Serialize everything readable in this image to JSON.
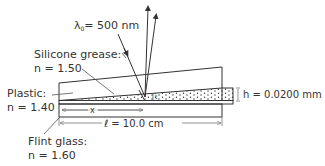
{
  "diagram": {
    "wavelength_label": "λ₀ = 500 nm",
    "wavelength_symbol": "λ",
    "wavelength_sub": "0",
    "wavelength_value": "= 500 nm",
    "silicone": {
      "name": "Silicone grease:",
      "index": "n = 1.50"
    },
    "plastic": {
      "name": "Plastic:",
      "index": "n = 1.40"
    },
    "flint": {
      "name": "Flint glass:",
      "index": "n = 1.60"
    },
    "height": {
      "label": "h = 0.0200 mm"
    },
    "length": {
      "label": "ℓ = 10.0 cm"
    },
    "x_label": "x",
    "t_label": "t",
    "colors": {
      "line": "#333333",
      "hatch": "#b5b5b5",
      "dimension": "#777777",
      "background": "#ffffff"
    }
  }
}
